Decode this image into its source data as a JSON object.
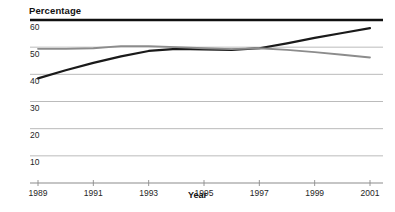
{
  "chart_data": {
    "type": "line",
    "title": "Percentage",
    "xlabel": "Year",
    "ylabel": "Percentage",
    "grid": true,
    "legend": "none",
    "xlim": [
      1989,
      2001
    ],
    "ylim": [
      0,
      60
    ],
    "ytick_labels": [
      "60",
      "50",
      "40",
      "30",
      "20",
      "10"
    ],
    "yticks": [
      60,
      50,
      40,
      30,
      20,
      10
    ],
    "xtick_labels": [
      "1989",
      "1991",
      "1993",
      "1995",
      "1997",
      "1999",
      "2001"
    ],
    "xticks": [
      1989,
      1991,
      1993,
      1995,
      1997,
      1999,
      2001
    ],
    "x": [
      1989,
      1990,
      1991,
      1992,
      1993,
      1994,
      1995,
      1996,
      1997,
      1998,
      1999,
      2000,
      2001
    ],
    "series": [
      {
        "name": "dark-series",
        "color": "#1a1a1a",
        "width": 2.2,
        "values": [
          38.5,
          41.5,
          44.2,
          46.6,
          48.6,
          49.4,
          49.2,
          49.0,
          49.6,
          51.4,
          53.4,
          55.2,
          57.0
        ]
      },
      {
        "name": "gray-series",
        "color": "#8c8c8c",
        "width": 1.8,
        "values": [
          49.4,
          49.4,
          49.6,
          50.4,
          50.4,
          50.0,
          49.6,
          49.3,
          49.6,
          49.0,
          48.2,
          47.2,
          46.2
        ]
      }
    ]
  },
  "axes": {
    "top_rule_value": 60,
    "gridline_color": "#b3b3b3",
    "top_rule_color": "#111111",
    "axis_color": "#8c8c8c"
  }
}
